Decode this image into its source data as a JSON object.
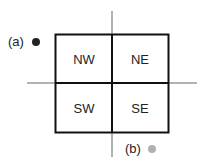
{
  "diagram": {
    "type": "quadrant",
    "quadrants": [
      {
        "id": "nw",
        "label": "NW"
      },
      {
        "id": "ne",
        "label": "NE"
      },
      {
        "id": "sw",
        "label": "SW"
      },
      {
        "id": "se",
        "label": "SE"
      }
    ],
    "points": [
      {
        "id": "a",
        "label": "(a)",
        "color": "#222222"
      },
      {
        "id": "b",
        "label": "(b)",
        "color": "#b0b0b0"
      }
    ],
    "colors": {
      "axis": "#999999",
      "box": "#111111",
      "text": "#222222"
    }
  }
}
